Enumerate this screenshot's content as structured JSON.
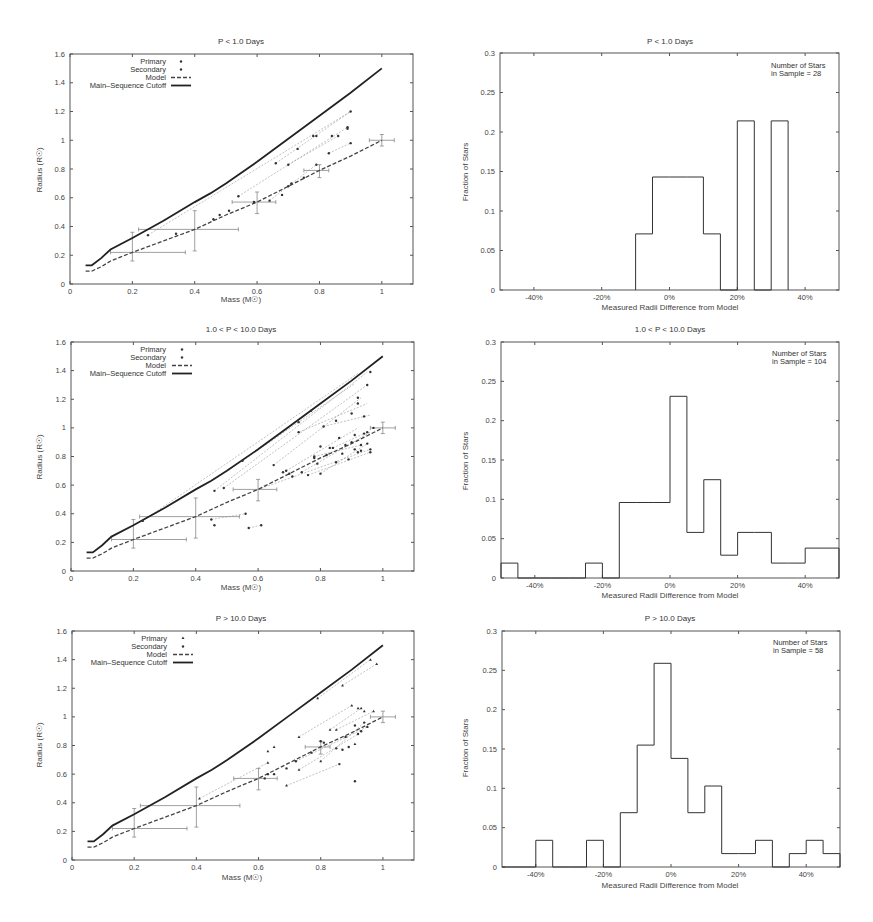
{
  "figure": {
    "scatter_panels": [
      {
        "title": "P < 1.0 Days"
      },
      {
        "title": "1.0 < P < 10.0 Days"
      },
      {
        "title": "P > 10.0 Days"
      }
    ],
    "hist_panels": [
      {
        "title": "P < 1.0 Days",
        "annotation_line1": "Number of Stars",
        "annotation_line2": "in Sample = 28"
      },
      {
        "title": "1.0 < P < 10.0 Days",
        "annotation_line1": "Number of Stars",
        "annotation_line2": "in Sample = 104"
      },
      {
        "title": "P > 10.0 Days",
        "annotation_line1": "Number of Stars",
        "annotation_line2": "in Sample = 58"
      }
    ],
    "scatter_xlabel": "Mass (M☉)",
    "scatter_ylabel": "Radius (R☉)",
    "hist_xlabel": "Measured Radii Difference from Model",
    "hist_ylabel": "Fraction of Stars",
    "legend": {
      "primary": "Primary",
      "secondary": "Secondary",
      "model": "Model",
      "cutoff": "Main–Sequence Cutoff"
    }
  },
  "chart_data": [
    {
      "type": "line",
      "title": "P < 1.0 Days",
      "xlabel": "Mass (M☉)",
      "ylabel": "Radius (R☉)",
      "xlim": [
        0,
        1.1
      ],
      "ylim": [
        0,
        1.6
      ],
      "xticks": [
        "0",
        "0.2",
        "0.4",
        "0.6",
        "0.8",
        "1"
      ],
      "yticks": [
        "0",
        "0.2",
        "0.4",
        "0.6",
        "0.8",
        "1",
        "1.2",
        "1.4",
        "1.6"
      ],
      "legend_position": "upper left",
      "series": [
        {
          "name": "Main-Sequence Cutoff",
          "x": [
            0.05,
            0.07,
            0.1,
            0.13,
            0.2,
            0.3,
            0.4,
            0.45,
            0.5,
            0.6,
            0.7,
            0.8,
            0.9,
            1.0
          ],
          "y": [
            0.13,
            0.13,
            0.18,
            0.24,
            0.32,
            0.44,
            0.57,
            0.63,
            0.7,
            0.85,
            1.01,
            1.17,
            1.33,
            1.5
          ]
        },
        {
          "name": "Model",
          "x": [
            0.05,
            0.07,
            0.1,
            0.13,
            0.2,
            0.3,
            0.4,
            0.5,
            0.6,
            0.7,
            0.8,
            0.9,
            1.0
          ],
          "y": [
            0.09,
            0.09,
            0.12,
            0.16,
            0.22,
            0.3,
            0.38,
            0.48,
            0.57,
            0.68,
            0.79,
            0.89,
            1.0
          ]
        },
        {
          "name": "Primary",
          "x": [
            0.25,
            0.34,
            0.46,
            0.48,
            0.51,
            0.54,
            0.64,
            0.66,
            0.68,
            0.7,
            0.73,
            0.78,
            0.79,
            0.83,
            0.84,
            0.86,
            0.89,
            0.9,
            0.9
          ],
          "y": [
            0.34,
            0.35,
            0.45,
            0.48,
            0.51,
            0.61,
            0.58,
            0.84,
            0.62,
            0.83,
            0.94,
            1.03,
            1.03,
            0.91,
            1.03,
            1.03,
            1.09,
            1.2,
            0.98
          ]
        },
        {
          "name": "Secondary",
          "x": [
            0.59,
            0.7,
            0.71,
            0.75,
            0.79,
            0.89
          ],
          "y": [
            0.57,
            0.68,
            0.7,
            0.74,
            0.83,
            1.08
          ]
        }
      ],
      "error_bars": [
        {
          "x": 0.2,
          "y": 0.22,
          "xerr": [
            0.07,
            0.17
          ],
          "yerr": [
            0.06,
            0.14
          ]
        },
        {
          "x": 0.4,
          "y": 0.38,
          "xerr": [
            0.18,
            0.14
          ],
          "yerr": [
            0.15,
            0.13
          ]
        },
        {
          "x": 0.6,
          "y": 0.57,
          "xerr": [
            0.08,
            0.06
          ],
          "yerr": [
            0.08,
            0.07
          ]
        },
        {
          "x": 0.8,
          "y": 0.79,
          "xerr": [
            0.05,
            0.03
          ],
          "yerr": [
            0.05,
            0.04
          ]
        },
        {
          "x": 1.0,
          "y": 1.0,
          "xerr": [
            0.04,
            0.04
          ],
          "yerr": [
            0.04,
            0.04
          ]
        }
      ],
      "connectors": [
        [
          0.25,
          0.34,
          0.9,
          1.2
        ],
        [
          0.54,
          0.61,
          0.89,
          1.09
        ],
        [
          0.66,
          0.84,
          0.9,
          1.2
        ],
        [
          0.7,
          0.83,
          0.86,
          1.03
        ],
        [
          0.83,
          0.91,
          0.9,
          0.98
        ],
        [
          0.64,
          0.58,
          0.79,
          0.83
        ]
      ]
    },
    {
      "type": "line",
      "title": "1.0 < P < 10.0 Days",
      "xlabel": "Mass (M☉)",
      "ylabel": "Radius (R☉)",
      "xlim": [
        0,
        1.1
      ],
      "ylim": [
        0,
        1.6
      ],
      "xticks": [
        "0",
        "0.2",
        "0.4",
        "0.6",
        "0.8",
        "1"
      ],
      "yticks": [
        "0",
        "0.2",
        "0.4",
        "0.6",
        "0.8",
        "1",
        "1.2",
        "1.4",
        "1.6"
      ],
      "legend_position": "upper left",
      "series": [
        {
          "name": "Main-Sequence Cutoff",
          "x": [
            0.05,
            0.07,
            0.1,
            0.13,
            0.2,
            0.3,
            0.4,
            0.45,
            0.5,
            0.6,
            0.7,
            0.8,
            0.9,
            1.0
          ],
          "y": [
            0.13,
            0.13,
            0.18,
            0.24,
            0.32,
            0.44,
            0.57,
            0.63,
            0.7,
            0.85,
            1.01,
            1.17,
            1.33,
            1.5
          ]
        },
        {
          "name": "Model",
          "x": [
            0.05,
            0.07,
            0.1,
            0.13,
            0.2,
            0.3,
            0.4,
            0.5,
            0.6,
            0.7,
            0.8,
            0.9,
            1.0
          ],
          "y": [
            0.09,
            0.09,
            0.12,
            0.16,
            0.22,
            0.3,
            0.38,
            0.48,
            0.57,
            0.68,
            0.79,
            0.89,
            1.0
          ]
        },
        {
          "name": "Primary",
          "x": [
            0.23,
            0.46,
            0.49,
            0.55,
            0.56,
            0.61,
            0.65,
            0.69,
            0.7,
            0.73,
            0.73,
            0.77,
            0.78,
            0.8,
            0.81,
            0.83,
            0.85,
            0.86,
            0.88,
            0.9,
            0.91,
            0.92,
            0.92,
            0.93,
            0.94,
            0.95,
            0.95,
            0.96,
            0.96,
            0.97
          ],
          "y": [
            0.35,
            0.56,
            0.58,
            0.77,
            0.4,
            0.32,
            0.74,
            0.7,
            0.68,
            0.97,
            1.04,
            1.12,
            0.79,
            0.87,
            1.01,
            0.86,
            1.05,
            0.93,
            0.88,
            1.1,
            0.85,
            1.17,
            1.21,
            0.84,
            1.08,
            1.3,
            0.89,
            1.39,
            0.85,
            1.0
          ]
        },
        {
          "name": "Secondary",
          "x": [
            0.45,
            0.46,
            0.57,
            0.68,
            0.71,
            0.74,
            0.76,
            0.78,
            0.79,
            0.8,
            0.82,
            0.84,
            0.85,
            0.87,
            0.89,
            0.9,
            0.91,
            0.92,
            0.93,
            0.94,
            0.95,
            0.96
          ],
          "y": [
            0.36,
            0.32,
            0.3,
            0.69,
            0.66,
            0.69,
            0.67,
            0.8,
            0.75,
            0.68,
            0.81,
            0.86,
            0.76,
            0.82,
            0.78,
            0.9,
            0.95,
            0.83,
            0.88,
            0.96,
            0.97,
            0.83
          ]
        }
      ],
      "error_bars": [
        {
          "x": 0.2,
          "y": 0.22,
          "xerr": [
            0.07,
            0.17
          ],
          "yerr": [
            0.06,
            0.14
          ]
        },
        {
          "x": 0.4,
          "y": 0.38,
          "xerr": [
            0.18,
            0.14
          ],
          "yerr": [
            0.15,
            0.13
          ]
        },
        {
          "x": 0.6,
          "y": 0.57,
          "xerr": [
            0.08,
            0.06
          ],
          "yerr": [
            0.08,
            0.07
          ]
        },
        {
          "x": 1.0,
          "y": 1.0,
          "xerr": [
            0.04,
            0.04
          ],
          "yerr": [
            0.04,
            0.04
          ]
        }
      ],
      "connectors": [
        [
          0.23,
          0.35,
          0.92,
          1.38
        ],
        [
          0.46,
          0.56,
          0.95,
          1.39
        ],
        [
          0.49,
          0.58,
          0.95,
          1.3
        ],
        [
          0.55,
          0.77,
          0.91,
          1.31
        ],
        [
          0.65,
          0.74,
          0.93,
          1.21
        ],
        [
          0.73,
          0.97,
          0.95,
          1.17
        ],
        [
          0.81,
          1.01,
          0.96,
          1.09
        ],
        [
          0.69,
          0.7,
          0.92,
          1.0
        ],
        [
          0.74,
          0.69,
          0.96,
          0.97
        ],
        [
          0.45,
          0.36,
          0.56,
          0.4
        ],
        [
          0.57,
          0.3,
          0.61,
          0.32
        ],
        [
          0.6,
          0.57,
          0.96,
          0.85
        ],
        [
          0.76,
          0.67,
          0.96,
          0.83
        ],
        [
          0.8,
          0.68,
          0.95,
          0.89
        ],
        [
          0.78,
          0.8,
          0.93,
          0.88
        ],
        [
          0.84,
          0.86,
          0.94,
          0.96
        ]
      ]
    },
    {
      "type": "line",
      "title": "P > 10.0 Days",
      "xlabel": "Mass (M☉)",
      "ylabel": "Radius (R☉)",
      "xlim": [
        0,
        1.1
      ],
      "ylim": [
        0,
        1.6
      ],
      "xticks": [
        "0",
        "0.2",
        "0.4",
        "0.6",
        "0.8",
        "1"
      ],
      "yticks": [
        "0",
        "0.2",
        "0.4",
        "0.6",
        "0.8",
        "1",
        "1.2",
        "1.4",
        "1.6"
      ],
      "legend_position": "upper left",
      "series": [
        {
          "name": "Main-Sequence Cutoff",
          "x": [
            0.05,
            0.07,
            0.1,
            0.13,
            0.2,
            0.3,
            0.4,
            0.45,
            0.5,
            0.6,
            0.7,
            0.8,
            0.9,
            1.0
          ],
          "y": [
            0.13,
            0.13,
            0.18,
            0.24,
            0.32,
            0.44,
            0.57,
            0.63,
            0.7,
            0.85,
            1.01,
            1.17,
            1.33,
            1.5
          ]
        },
        {
          "name": "Model",
          "x": [
            0.05,
            0.07,
            0.1,
            0.13,
            0.2,
            0.3,
            0.4,
            0.5,
            0.6,
            0.7,
            0.8,
            0.9,
            1.0
          ],
          "y": [
            0.09,
            0.09,
            0.12,
            0.16,
            0.22,
            0.3,
            0.38,
            0.48,
            0.57,
            0.68,
            0.79,
            0.89,
            1.0
          ]
        },
        {
          "name": "Primary",
          "x": [
            0.41,
            0.63,
            0.63,
            0.65,
            0.69,
            0.73,
            0.73,
            0.79,
            0.8,
            0.83,
            0.85,
            0.87,
            0.9,
            0.91,
            0.92,
            0.93,
            0.94,
            0.96,
            0.97,
            0.98
          ],
          "y": [
            0.43,
            0.76,
            0.68,
            0.79,
            0.52,
            0.86,
            0.63,
            1.13,
            0.69,
            0.91,
            0.91,
            1.22,
            1.08,
            0.81,
            1.06,
            1.06,
            1.04,
            1.4,
            1.04,
            1.37
          ]
        },
        {
          "name": "Secondary",
          "x": [
            0.62,
            0.63,
            0.65,
            0.69,
            0.72,
            0.77,
            0.8,
            0.81,
            0.85,
            0.86,
            0.87,
            0.88,
            0.89,
            0.91,
            0.91,
            0.92,
            0.93,
            0.94,
            0.95
          ],
          "y": [
            0.57,
            0.6,
            0.6,
            0.64,
            0.69,
            0.75,
            0.83,
            0.82,
            0.78,
            0.67,
            0.77,
            0.86,
            0.79,
            0.94,
            0.55,
            0.88,
            0.9,
            0.96,
            0.93
          ]
        }
      ],
      "error_bars": [
        {
          "x": 0.2,
          "y": 0.22,
          "xerr": [
            0.07,
            0.17
          ],
          "yerr": [
            0.06,
            0.14
          ]
        },
        {
          "x": 0.4,
          "y": 0.38,
          "xerr": [
            0.18,
            0.14
          ],
          "yerr": [
            0.15,
            0.13
          ]
        },
        {
          "x": 0.6,
          "y": 0.57,
          "xerr": [
            0.08,
            0.06
          ],
          "yerr": [
            0.08,
            0.07
          ]
        },
        {
          "x": 0.8,
          "y": 0.79,
          "xerr": [
            0.05,
            0.03
          ],
          "yerr": [
            0.05,
            0.04
          ]
        },
        {
          "x": 1.0,
          "y": 1.0,
          "xerr": [
            0.04,
            0.04
          ],
          "yerr": [
            0.04,
            0.04
          ]
        }
      ],
      "connectors": [
        [
          0.79,
          1.13,
          0.96,
          1.4
        ],
        [
          0.87,
          1.22,
          0.98,
          1.37
        ],
        [
          0.41,
          0.43,
          0.63,
          0.68
        ],
        [
          0.73,
          0.86,
          0.9,
          1.08
        ],
        [
          0.83,
          0.91,
          0.93,
          1.06
        ],
        [
          0.69,
          0.52,
          0.86,
          0.67
        ],
        [
          0.73,
          0.63,
          0.92,
          0.88
        ],
        [
          0.8,
          0.69,
          0.94,
          0.96
        ],
        [
          0.85,
          0.91,
          0.97,
          1.04
        ],
        [
          0.72,
          0.69,
          0.95,
          0.93
        ]
      ]
    },
    {
      "type": "bar",
      "title": "P < 1.0 Days",
      "xlabel": "Measured Radii Difference from Model",
      "ylabel": "Fraction of Stars",
      "xlim": [
        -50,
        50
      ],
      "ylim": [
        0,
        0.3
      ],
      "xticks": [
        "-40%",
        "-20%",
        "0%",
        "20%",
        "40%"
      ],
      "yticks": [
        "0",
        "0.05",
        "0.1",
        "0.15",
        "0.2",
        "0.25",
        "0.3"
      ],
      "annotation": "Number of Stars in Sample = 28",
      "bin_edges": [
        -10,
        -5,
        0,
        5,
        10,
        15,
        20,
        25,
        30,
        35
      ],
      "values": [
        0.071,
        0.143,
        0.143,
        0.143,
        0.071,
        0,
        0.214,
        0,
        0.214
      ]
    },
    {
      "type": "bar",
      "title": "1.0 < P < 10.0 Days",
      "xlabel": "Measured Radii Difference from Model",
      "ylabel": "Fraction of Stars",
      "xlim": [
        -50,
        50
      ],
      "ylim": [
        0,
        0.3
      ],
      "xticks": [
        "-40%",
        "-20%",
        "0%",
        "20%",
        "40%"
      ],
      "yticks": [
        "0",
        "0.05",
        "0.1",
        "0.15",
        "0.2",
        "0.25",
        "0.3"
      ],
      "annotation": "Number of Stars in Sample = 104",
      "bin_edges": [
        -50,
        -45,
        -40,
        -35,
        -30,
        -25,
        -20,
        -15,
        -10,
        -5,
        0,
        5,
        10,
        15,
        20,
        25,
        30,
        35,
        40,
        45,
        50
      ],
      "values": [
        0.019,
        0,
        0,
        0,
        0,
        0.019,
        0,
        0.096,
        0.096,
        0.096,
        0.231,
        0.058,
        0.125,
        0.029,
        0.058,
        0.058,
        0.019,
        0.019,
        0.038,
        0.038
      ]
    },
    {
      "type": "bar",
      "title": "P > 10.0 Days",
      "xlabel": "Measured Radii Difference from Model",
      "ylabel": "Fraction of Stars",
      "xlim": [
        -50,
        50
      ],
      "ylim": [
        0,
        0.3
      ],
      "xticks": [
        "-40%",
        "-20%",
        "0%",
        "20%",
        "40%"
      ],
      "yticks": [
        "0",
        "0.05",
        "0.1",
        "0.15",
        "0.2",
        "0.25",
        "0.3"
      ],
      "annotation": "Number of Stars in Sample = 58",
      "bin_edges": [
        -50,
        -45,
        -40,
        -35,
        -30,
        -25,
        -20,
        -15,
        -10,
        -5,
        0,
        5,
        10,
        15,
        20,
        25,
        30,
        35,
        40,
        45,
        50
      ],
      "values": [
        0,
        0,
        0.034,
        0,
        0,
        0.034,
        0,
        0.069,
        0.155,
        0.259,
        0.138,
        0.069,
        0.103,
        0.017,
        0.017,
        0.034,
        0,
        0.017,
        0.034,
        0.017
      ]
    }
  ]
}
